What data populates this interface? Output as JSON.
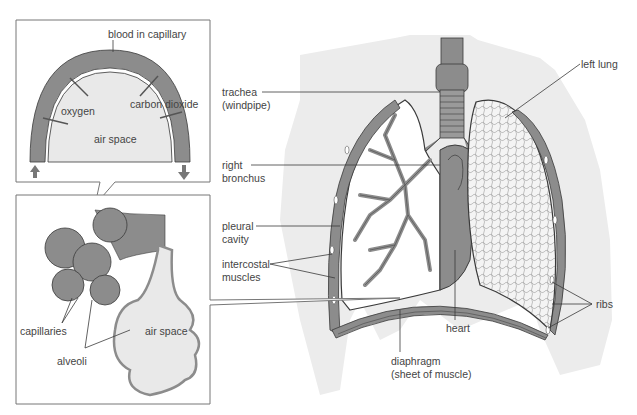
{
  "diagram": {
    "type": "anatomy-diagram",
    "colors": {
      "tissue_gray": "#8c8c8c",
      "light_fill": "#e9e9e9",
      "body_silhouette": "#ececec",
      "outline": "#3a3a3a",
      "text": "#444444"
    }
  },
  "inset_top": {
    "title_label": "blood in capillary",
    "labels": {
      "oxygen": "oxygen",
      "carbon_line1": "carbon",
      "carbon_line2": "dioxide",
      "air_space": "air space"
    }
  },
  "inset_bottom": {
    "labels": {
      "capillaries": "capillaries",
      "alveoli": "alveoli",
      "air_line1": "air",
      "air_line2": "space"
    }
  },
  "main_labels": {
    "trachea_line1": "trachea",
    "trachea_line2": "(windpipe)",
    "right_bronchus_line1": "right",
    "right_bronchus_line2": "bronchus",
    "pleural_line1": "pleural",
    "pleural_line2": "cavity",
    "intercostal_line1": "intercostal",
    "intercostal_line2": "muscles",
    "left_lung": "left lung",
    "heart": "heart",
    "ribs": "ribs",
    "diaphragm_line1": "diaphragm",
    "diaphragm_line2": "(sheet of muscle)"
  }
}
